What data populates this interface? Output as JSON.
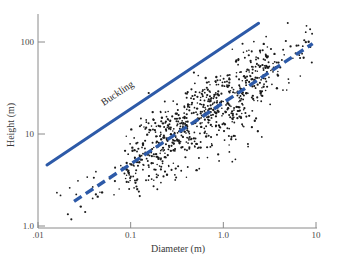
{
  "chart_data": {
    "type": "scatter",
    "title": "",
    "xlabel": "Diameter (m)",
    "ylabel": "Height (m)",
    "xscale": "log",
    "yscale": "log",
    "xlim": [
      0.01,
      10
    ],
    "ylim": [
      1.0,
      200
    ],
    "grid": false,
    "legend": "none",
    "xticks": [
      {
        "value": 0.01,
        "label": ".01"
      },
      {
        "value": 0.1,
        "label": "0.1"
      },
      {
        "value": 1.0,
        "label": "1.0"
      },
      {
        "value": 10,
        "label": "10"
      }
    ],
    "yticks": [
      {
        "value": 1.0,
        "label": "1.0"
      },
      {
        "value": 10,
        "label": "10"
      },
      {
        "value": 100,
        "label": "100"
      }
    ],
    "annotations": [
      {
        "text": "Buckling",
        "x": 0.075,
        "y": 26,
        "rotation": -27
      }
    ],
    "series": [
      {
        "name": "Buckling limit",
        "type": "line",
        "style": "solid",
        "color": "#2d5aa8",
        "width": 3,
        "points": [
          [
            0.0125,
            4.6
          ],
          [
            2.4,
            160
          ]
        ]
      },
      {
        "name": "Safety-factor trend",
        "type": "line",
        "style": "dashed",
        "color": "#2d5aa8",
        "width": 3.4,
        "dash": "9 5",
        "points": [
          [
            0.0245,
            1.85
          ],
          [
            9.2,
            96
          ]
        ]
      },
      {
        "name": "Tree measurements",
        "type": "scatter",
        "color": "#1a1a1a",
        "marker_size": 1.5,
        "n": 600,
        "x": [
          0.0155,
          0.0162,
          0.019,
          0.0225,
          0.0242,
          0.026,
          0.028,
          0.0295,
          0.031,
          0.0325,
          0.0338,
          0.0355,
          0.037,
          0.0382,
          0.0398,
          0.041,
          0.0425,
          0.0438,
          0.045,
          0.0462,
          0.0478,
          0.049,
          0.051,
          0.0525,
          0.054,
          0.0558,
          0.0572,
          0.0588,
          0.0602,
          0.062,
          0.0635,
          0.065,
          0.0668,
          0.0682,
          0.0698,
          0.0712,
          0.0728,
          0.0742,
          0.0758,
          0.0772,
          0.079,
          0.0805,
          0.082,
          0.0838,
          0.0852,
          0.0868,
          0.0882,
          0.0898,
          0.0912,
          0.0928,
          0.0945,
          0.096,
          0.0978,
          0.0992,
          0.101,
          0.1025,
          0.104,
          0.1058,
          0.1072,
          0.1088,
          0.1105,
          0.112,
          0.1138,
          0.1152,
          0.117,
          0.1185,
          0.12,
          0.1218,
          0.1235,
          0.125,
          0.1268,
          0.1285,
          0.13,
          0.1318,
          0.1335,
          0.135,
          0.1368,
          0.1385,
          0.14,
          0.1418,
          0.1435,
          0.1452,
          0.147,
          0.1485,
          0.1502,
          0.152,
          0.1538,
          0.1555,
          0.1572,
          0.159,
          0.1608,
          0.1625,
          0.1642,
          0.166,
          0.1678,
          0.1695,
          0.1712,
          0.173,
          0.1748,
          0.1765,
          0.1782,
          0.18,
          0.182,
          0.1838,
          0.1855,
          0.1875,
          0.1892,
          0.191,
          0.193,
          0.1948,
          0.1965,
          0.1985,
          0.2002,
          0.202,
          0.204,
          0.2058,
          0.2078,
          0.2095,
          0.2115,
          0.2135,
          0.2152,
          0.2172,
          0.2192,
          0.221,
          0.223,
          0.225,
          0.227,
          0.229,
          0.231,
          0.233,
          0.235,
          0.237,
          0.239,
          0.241,
          0.243,
          0.245,
          0.247,
          0.249,
          0.2512,
          0.2532,
          0.2552,
          0.2575,
          0.2595,
          0.2618,
          0.2638,
          0.266,
          0.2682,
          0.2702,
          0.2725,
          0.2748,
          0.277,
          0.2792,
          0.2815,
          0.2838,
          0.286,
          0.2882,
          0.2905,
          0.2928,
          0.2952,
          0.2975,
          0.2998,
          0.3022,
          0.3045,
          0.307,
          0.3092,
          0.3118,
          0.314,
          0.3165,
          0.319,
          0.3215,
          0.324,
          0.3265,
          0.329,
          0.3315,
          0.334,
          0.3368,
          0.3392,
          0.342,
          0.3445,
          0.3472,
          0.3498,
          0.3525,
          0.3552,
          0.358,
          0.3608,
          0.3635,
          0.3662,
          0.369,
          0.3718,
          0.3748,
          0.3775,
          0.3805,
          0.3832,
          0.3862,
          0.389,
          0.392,
          0.395,
          0.398,
          0.401,
          0.404,
          0.407,
          0.41,
          0.4132,
          0.4162,
          0.4195,
          0.4225,
          0.4258,
          0.429,
          0.4322,
          0.4355,
          0.4388,
          0.442,
          0.4455,
          0.4488,
          0.4522,
          0.4555,
          0.459,
          0.4625,
          0.4658,
          0.4695,
          0.473,
          0.4765,
          0.48,
          0.4838,
          0.4872,
          0.491,
          0.4948,
          0.4985,
          0.5022,
          0.506,
          0.51,
          0.5138,
          0.5178,
          0.5215,
          0.5255,
          0.5295,
          0.5335,
          0.5375,
          0.5415,
          0.5458,
          0.5498,
          0.554,
          0.5582,
          0.5625,
          0.5665,
          0.571,
          0.5752,
          0.5795,
          0.584,
          0.5882,
          0.5928,
          0.5972,
          0.6018,
          0.6062,
          0.6108,
          0.6155,
          0.62,
          0.6248,
          0.6295,
          0.6342,
          0.639,
          0.6438,
          0.6488,
          0.6535,
          0.6585,
          0.6635,
          0.6685,
          0.6735,
          0.6788,
          0.6838,
          0.689,
          0.6942,
          0.6995,
          0.7048,
          0.71,
          0.7155,
          0.721,
          0.7265,
          0.732,
          0.7375,
          0.7432,
          0.749,
          0.7548,
          0.7605,
          0.7665,
          0.7722,
          0.7782,
          0.7842,
          0.7905,
          0.7965,
          0.8028,
          0.809,
          0.8155,
          0.8218,
          0.8282,
          0.8348,
          0.8412,
          0.848,
          0.8545,
          0.8612,
          0.868,
          0.875,
          0.8818,
          0.8888,
          0.8958,
          0.903,
          0.91,
          0.9175,
          0.9248,
          0.932,
          0.9395,
          0.947,
          0.9548,
          0.9622,
          0.97,
          0.978,
          0.9858,
          0.994,
          1.002,
          1.0102,
          1.0185,
          1.027,
          1.0352,
          1.0438,
          1.0525,
          1.061,
          1.07,
          1.0788,
          1.0878,
          1.097,
          1.106,
          1.1155,
          1.1248,
          1.1342,
          1.144,
          1.1535,
          1.1635,
          1.1732,
          1.1832,
          1.1935,
          1.2035,
          1.214,
          1.2242,
          1.235,
          1.2455,
          1.2562,
          1.2672,
          1.278,
          1.2892,
          1.3005,
          1.3118,
          1.3232,
          1.335,
          1.3465,
          1.3585,
          1.3705,
          1.3825,
          1.395,
          1.4072,
          1.42,
          1.4325,
          1.4455,
          1.4585,
          1.4715,
          1.485,
          1.4985,
          1.512,
          1.526,
          1.54,
          1.5542,
          1.5685,
          1.583,
          1.598,
          1.6128,
          1.628,
          1.6432,
          1.6588,
          1.6745,
          1.6905,
          1.7065,
          1.723,
          1.7395,
          1.7562,
          1.7735,
          1.7905,
          1.808,
          1.826,
          1.844,
          1.862,
          1.8805,
          1.899,
          1.918,
          1.937,
          1.9565,
          1.976,
          1.996,
          2.016,
          2.0365,
          2.057,
          2.078,
          2.0992,
          2.1205,
          2.1425,
          2.1645,
          2.187,
          2.2095,
          2.2325,
          2.256,
          2.2795,
          2.3035,
          2.328,
          2.3525,
          2.3775,
          2.403,
          2.4285,
          2.4545,
          2.4812,
          2.508,
          2.535,
          2.563,
          2.591,
          2.6195,
          2.6485,
          2.678,
          2.708,
          2.738,
          2.769,
          2.8,
          2.832,
          2.864,
          2.897,
          2.93,
          2.964,
          2.998,
          3.033,
          3.069,
          3.105,
          3.142,
          3.179,
          3.217,
          3.256,
          3.295,
          3.335,
          3.376,
          3.417,
          3.46,
          3.502,
          3.546,
          3.59,
          3.636,
          3.682,
          3.728,
          3.776,
          3.824,
          3.874,
          3.924,
          3.975,
          4.027,
          4.08,
          4.134,
          4.188,
          4.244,
          4.301,
          4.359,
          4.418,
          4.478,
          4.539,
          4.601,
          4.665,
          4.729,
          4.795,
          4.862,
          4.93,
          5.0,
          5.071,
          5.143,
          5.217,
          5.292,
          5.369,
          5.447,
          5.527,
          5.608,
          5.691,
          5.775,
          5.861,
          5.949,
          6.039,
          6.13,
          6.223,
          6.318,
          6.415,
          6.514,
          6.615,
          6.718,
          6.823,
          6.93,
          7.04,
          7.152,
          7.266,
          7.382,
          7.501,
          7.623,
          7.747,
          7.874,
          8.003,
          8.135,
          8.27,
          8.408,
          8.549,
          8.693,
          8.84,
          8.99,
          9.143
        ],
        "y_note": "heights cluster about the dashed trend y = 13.3*d^0.62 with roughly +-0.22 decades of scatter; see rendered points"
      }
    ],
    "axes_color": "#8a8a8a",
    "background": "#ffffff"
  },
  "figure": {
    "xlabel": "Diameter (m)",
    "ylabel": "Height (m)",
    "buckling_label": "Buckling",
    "xtick_labels": [
      ".01",
      "0.1",
      "1.0",
      "10"
    ],
    "ytick_labels": [
      "1.0",
      "10",
      "100"
    ]
  }
}
